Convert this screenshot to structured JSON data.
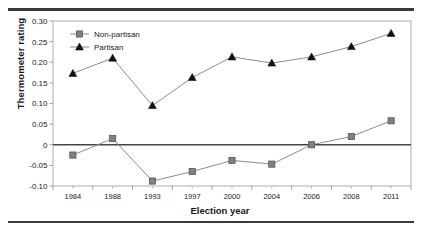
{
  "chart_data": {
    "type": "line",
    "title": "",
    "xlabel": "Election year",
    "ylabel": "Thermometer rating",
    "categories": [
      "1984",
      "1988",
      "1993",
      "1997",
      "2000",
      "2004",
      "2006",
      "2008",
      "2011"
    ],
    "ylim": [
      -0.1,
      0.3
    ],
    "ytick_labels": [
      "0.30",
      "0.25",
      "0.20",
      "0.15",
      "0.10",
      "0.05",
      "0",
      "-0.05",
      "-0.10"
    ],
    "ytick_values": [
      0.3,
      0.25,
      0.2,
      0.15,
      0.1,
      0.05,
      0.0,
      -0.05,
      -0.1
    ],
    "grid": false,
    "legend_position": "top-left-inside",
    "zero_line": true,
    "series": [
      {
        "name": "Non-partisan",
        "marker": "square",
        "color": "#808080",
        "values": [
          -0.025,
          0.015,
          -0.088,
          -0.065,
          -0.038,
          -0.047,
          0.0,
          0.02,
          0.058
        ]
      },
      {
        "name": "Partisan",
        "marker": "triangle",
        "color": "#111111",
        "values": [
          0.173,
          0.21,
          0.095,
          0.163,
          0.213,
          0.198,
          0.213,
          0.238,
          0.27
        ]
      }
    ]
  },
  "legend": {
    "items": [
      {
        "label": "Non-partisan",
        "marker": "square-marker"
      },
      {
        "label": "Partisan",
        "marker": "triangle-marker"
      }
    ]
  },
  "axes": {
    "y_title": "Thermometer rating",
    "x_title": "Election year"
  },
  "colors": {
    "nonpartisan": "#808080",
    "partisan": "#111111",
    "line": "#8c8c8c",
    "axis": "#9a9a9a",
    "zero_line": "#444444",
    "rule": "#3a3a3a"
  }
}
